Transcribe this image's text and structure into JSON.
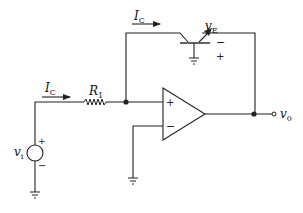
{
  "diagram": {
    "type": "circuit-schematic",
    "labels": {
      "ic_top": {
        "main": "I",
        "sub": "C"
      },
      "ic_input": {
        "main": "I",
        "sub": "C"
      },
      "r1": {
        "main": "R",
        "sub": "1"
      },
      "ve": {
        "main": "v",
        "sub": "E"
      },
      "vi": {
        "main": "v",
        "sub": "i"
      },
      "vo": {
        "main": "v",
        "sub": "0"
      }
    },
    "signs": {
      "ve_minus": "−",
      "ve_plus": "+",
      "opamp_plus": "+",
      "opamp_minus": "−",
      "source_plus": "+",
      "source_minus": "−"
    },
    "colors": {
      "wire": "#222222",
      "background": "#ffffff"
    }
  }
}
